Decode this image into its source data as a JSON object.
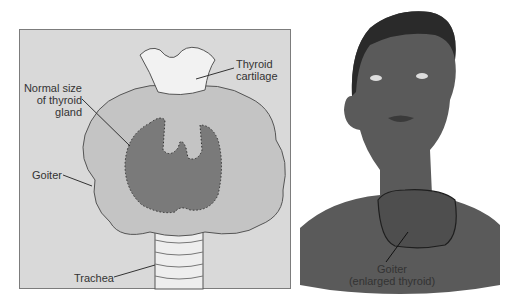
{
  "left_panel": {
    "labels": {
      "thyroid_cartilage": [
        "Thyroid",
        "cartilage"
      ],
      "normal_size": [
        "Normal size",
        "of thyroid",
        "gland"
      ],
      "goiter": "Goiter",
      "trachea": "Trachea"
    },
    "colors": {
      "panel_bg": "#d9d9d9",
      "goiter_fill": "#c4c4c4",
      "normal_gland_fill": "#7a7a7a",
      "cartilage_fill": "#f2f2f2"
    }
  },
  "right_panel": {
    "labels": {
      "goiter_line1": "Goiter",
      "goiter_line2": "(enlarged thyroid)"
    },
    "colors": {
      "skin": "#5a5a5a",
      "hair": "#2a2a2a"
    }
  }
}
